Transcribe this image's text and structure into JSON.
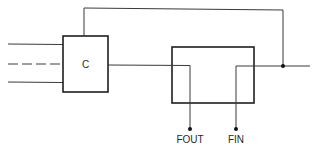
{
  "diagram": {
    "type": "block-diagram",
    "blocks": [
      {
        "id": "C",
        "label": "C"
      },
      {
        "id": "right-block",
        "label": ""
      }
    ],
    "terminals": [
      {
        "id": "fout",
        "label": "FOUT"
      },
      {
        "id": "fin",
        "label": "FIN"
      }
    ],
    "inputs": [
      {
        "style": "solid"
      },
      {
        "style": "dashed"
      },
      {
        "style": "solid"
      }
    ],
    "colors": {
      "line": "#3a3a3a",
      "box": "#1e1e1e",
      "background": "#ffffff"
    }
  }
}
